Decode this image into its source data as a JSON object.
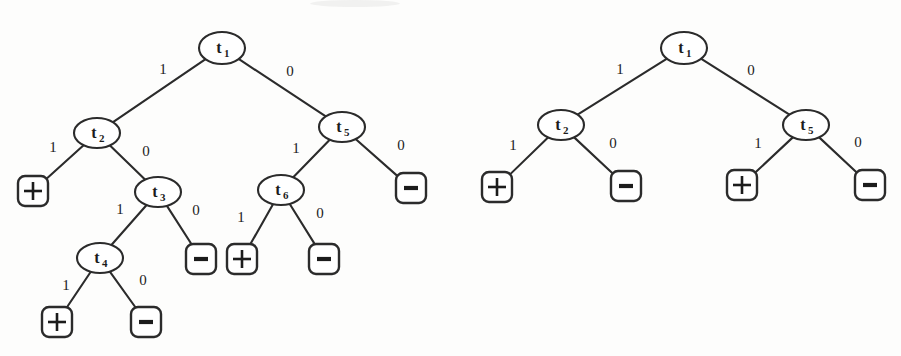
{
  "figure": {
    "title": "",
    "background_color": "#fdfdfc",
    "ink_color": "#2b2b2b"
  },
  "labels": {
    "edge_one": "1",
    "edge_zero": "0",
    "leaf_plus": "+",
    "leaf_minus": "-",
    "node_letter": "t"
  },
  "trees": [
    {
      "name": "left-tree",
      "nodes": [
        {
          "id": "L-t1",
          "label": "t",
          "sub": "1",
          "x": 222,
          "y": 48,
          "rx": 23,
          "ry": 16
        },
        {
          "id": "L-t2",
          "label": "t",
          "sub": "2",
          "x": 97,
          "y": 133,
          "rx": 23,
          "ry": 15
        },
        {
          "id": "L-t3",
          "label": "t",
          "sub": "3",
          "x": 158,
          "y": 192,
          "rx": 23,
          "ry": 15
        },
        {
          "id": "L-t4",
          "label": "t",
          "sub": "4",
          "x": 100,
          "y": 258,
          "rx": 23,
          "ry": 15
        },
        {
          "id": "L-t5",
          "label": "t",
          "sub": "5",
          "x": 342,
          "y": 127,
          "rx": 23,
          "ry": 15
        },
        {
          "id": "L-t6",
          "label": "t",
          "sub": "6",
          "x": 281,
          "y": 190,
          "rx": 23,
          "ry": 15
        }
      ],
      "leaves": [
        {
          "id": "L-leaf-1",
          "sign": "+",
          "x": 33,
          "y": 191
        },
        {
          "id": "L-leaf-2",
          "sign": "-",
          "x": 201,
          "y": 259
        },
        {
          "id": "L-leaf-3",
          "sign": "+",
          "x": 57,
          "y": 322
        },
        {
          "id": "L-leaf-4",
          "sign": "-",
          "x": 146,
          "y": 322
        },
        {
          "id": "L-leaf-5",
          "sign": "-",
          "x": 411,
          "y": 188
        },
        {
          "id": "L-leaf-6",
          "sign": "+",
          "x": 242,
          "y": 259
        },
        {
          "id": "L-leaf-7",
          "sign": "-",
          "x": 324,
          "y": 259
        }
      ],
      "edges": [
        {
          "from": "L-t1",
          "to": "L-t2",
          "label": "1",
          "lx": 163,
          "ly": 74
        },
        {
          "from": "L-t1",
          "to": "L-t5",
          "label": "0",
          "lx": 290,
          "ly": 76
        },
        {
          "from": "L-t2",
          "to": "L-leaf-1",
          "label": "1",
          "lx": 53,
          "ly": 152
        },
        {
          "from": "L-t2",
          "to": "L-t3",
          "label": "0",
          "lx": 146,
          "ly": 156
        },
        {
          "from": "L-t3",
          "to": "L-t4",
          "label": "1",
          "lx": 120,
          "ly": 214
        },
        {
          "from": "L-t3",
          "to": "L-leaf-2",
          "label": "0",
          "lx": 196,
          "ly": 215
        },
        {
          "from": "L-t4",
          "to": "L-leaf-3",
          "label": "1",
          "lx": 66,
          "ly": 290
        },
        {
          "from": "L-t4",
          "to": "L-leaf-4",
          "label": "0",
          "lx": 143,
          "ly": 285
        },
        {
          "from": "L-t5",
          "to": "L-t6",
          "label": "1",
          "lx": 296,
          "ly": 153
        },
        {
          "from": "L-t5",
          "to": "L-leaf-5",
          "label": "0",
          "lx": 401,
          "ly": 150
        },
        {
          "from": "L-t6",
          "to": "L-leaf-6",
          "label": "1",
          "lx": 241,
          "ly": 222
        },
        {
          "from": "L-t6",
          "to": "L-leaf-7",
          "label": "0",
          "lx": 320,
          "ly": 218
        }
      ]
    },
    {
      "name": "right-tree",
      "nodes": [
        {
          "id": "R-t1",
          "label": "t",
          "sub": "1",
          "x": 684,
          "y": 48,
          "rx": 23,
          "ry": 16
        },
        {
          "id": "R-t2",
          "label": "t",
          "sub": "2",
          "x": 561,
          "y": 125,
          "rx": 23,
          "ry": 15
        },
        {
          "id": "R-t5",
          "label": "t",
          "sub": "5",
          "x": 806,
          "y": 125,
          "rx": 23,
          "ry": 15
        }
      ],
      "leaves": [
        {
          "id": "R-leaf-1",
          "sign": "+",
          "x": 497,
          "y": 187
        },
        {
          "id": "R-leaf-2",
          "sign": "-",
          "x": 626,
          "y": 186
        },
        {
          "id": "R-leaf-3",
          "sign": "+",
          "x": 742,
          "y": 185
        },
        {
          "id": "R-leaf-4",
          "sign": "-",
          "x": 870,
          "y": 185
        }
      ],
      "edges": [
        {
          "from": "R-t1",
          "to": "R-t2",
          "label": "1",
          "lx": 620,
          "ly": 74
        },
        {
          "from": "R-t1",
          "to": "R-t5",
          "label": "0",
          "lx": 751,
          "ly": 75
        },
        {
          "from": "R-t2",
          "to": "R-leaf-1",
          "label": "1",
          "lx": 513,
          "ly": 150
        },
        {
          "from": "R-t2",
          "to": "R-leaf-2",
          "label": "0",
          "lx": 613,
          "ly": 148
        },
        {
          "from": "R-t5",
          "to": "R-leaf-3",
          "label": "1",
          "lx": 758,
          "ly": 148
        },
        {
          "from": "R-t5",
          "to": "R-leaf-4",
          "label": "0",
          "lx": 858,
          "ly": 147
        }
      ]
    }
  ]
}
